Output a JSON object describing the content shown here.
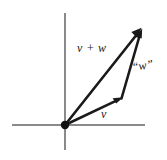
{
  "figure": {
    "width": 167,
    "height": 160,
    "background_color": "#ffffff"
  },
  "colors": {
    "axis": "#8a8a8a",
    "vector": "#1a1a1a",
    "label": "#1a1a1a",
    "origin_dot": "#111111"
  },
  "axes": {
    "horizontal": {
      "name": "x-axis",
      "x1": 12,
      "y1": 125,
      "x2": 145,
      "y2": 125,
      "stroke_width": 2
    },
    "vertical": {
      "name": "y-axis",
      "x1": 65,
      "y1": 13,
      "x2": 65,
      "y2": 150,
      "stroke_width": 2
    },
    "origin": {
      "x": 65,
      "y": 125,
      "radius": 4
    }
  },
  "vectors": [
    {
      "id": "v",
      "label": "v",
      "from": {
        "x": 65,
        "y": 125
      },
      "to": {
        "x": 122,
        "y": 98
      },
      "label_position": {
        "x": 101,
        "y": 108
      }
    },
    {
      "id": "w",
      "label": "“w”",
      "from": {
        "x": 122,
        "y": 98
      },
      "to": {
        "x": 142,
        "y": 29
      },
      "label_position": {
        "x": 131,
        "y": 61
      }
    },
    {
      "id": "v_plus_w",
      "label": "v + w",
      "from": {
        "x": 65,
        "y": 125
      },
      "to": {
        "x": 142,
        "y": 28
      },
      "label_position": {
        "x": 77,
        "y": 42
      }
    }
  ],
  "labels": {
    "v": "v",
    "w": "“w”",
    "v_plus_w": "v + w"
  }
}
